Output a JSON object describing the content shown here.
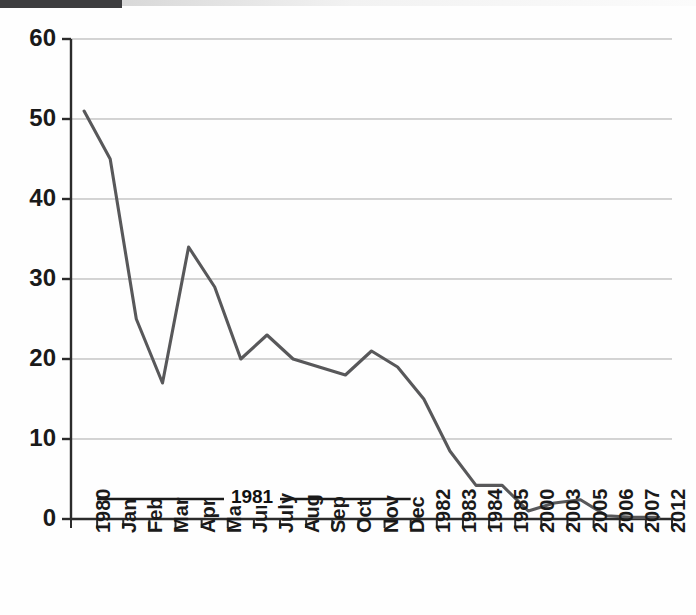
{
  "chart_data": {
    "type": "line",
    "title": "",
    "xlabel": "",
    "ylabel": "",
    "ylim": [
      0,
      60
    ],
    "yticks": [
      0,
      10,
      20,
      30,
      40,
      50,
      60
    ],
    "grid": true,
    "legend_position": "inside-bottom",
    "line_color": "#58585a",
    "categories": [
      "1980",
      "Jan",
      "Feb",
      "Mar",
      "Apr",
      "May",
      "Jun",
      "July",
      "Aug",
      "Sep",
      "Oct",
      "Nov",
      "Dec",
      "1982",
      "1983",
      "1984",
      "1985",
      "2000",
      "2003",
      "2005",
      "2006",
      "2007",
      "2012"
    ],
    "values": [
      51,
      45,
      25,
      17,
      34,
      29,
      20,
      23,
      20,
      19,
      18,
      21,
      19,
      15,
      8.5,
      4.2,
      4.2,
      1,
      2,
      2.4,
      0.4,
      0.2,
      0.2
    ],
    "annotations": [
      {
        "name": "series-bracket",
        "label": "1981",
        "span_start_category": "Jan",
        "span_end_category": "Dec",
        "value_position": 2.5
      }
    ]
  },
  "axes": {
    "y_tick_labels": [
      "60",
      "50",
      "40",
      "30",
      "20",
      "10",
      "0"
    ],
    "x_tick_labels": [
      "1980",
      "Jan",
      "Feb",
      "Mar",
      "Apr",
      "May",
      "Jun",
      "July",
      "Aug",
      "Sep",
      "Oct",
      "Nov",
      "Dec",
      "1982",
      "1983",
      "1984",
      "1985",
      "2000",
      "2003",
      "2005",
      "2006",
      "2007",
      "2012"
    ]
  },
  "colors": {
    "line": "#58585a",
    "axis": "#2b2b2b",
    "grid": "#a9a9a9",
    "text": "#1a1a1a",
    "scan_band": "#3d3d3f"
  }
}
